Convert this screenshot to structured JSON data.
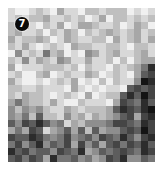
{
  "badge": {
    "label": "7"
  },
  "grid": {
    "cols": 21,
    "rows": 22,
    "levels": [
      "899878968897787779898",
      "878776887879869778787",
      "776897869866788798679",
      "768879786797876787687",
      "687767986788779687686",
      "786898789677887789778",
      "958784769895687688768",
      "785867856886887979766",
      "698887778797889787641",
      "879976987886798789632",
      "689989878698979788501",
      "778878889689898893232",
      "786778987896987731302",
      "646778689978889623413",
      "575657886787776312310",
      "564737785768676532621",
      "352313548675554223412",
      "646238653637365532302",
      "233124542543523413521",
      "425315342625363242313",
      "132433523416534323412",
      "324236144354652315534"
    ]
  }
}
